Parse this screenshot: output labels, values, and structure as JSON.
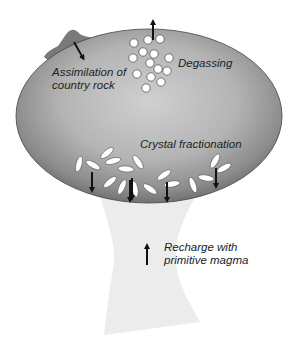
{
  "diagram": {
    "labels": {
      "assimilation": {
        "lines": [
          "Assimilation of",
          "country rock"
        ]
      },
      "degassing": {
        "lines": [
          "Degassing"
        ]
      },
      "crystal_fractionation": {
        "lines": [
          "Crystal fractionation"
        ]
      },
      "recharge": {
        "lines": [
          "Recharge with",
          "primitive magma"
        ]
      }
    },
    "components": {
      "magma_chamber": "ellipse with gray radial gradient",
      "conduit": "pale gray feeder conduit below chamber",
      "country_rock": "dark gray blob on upper-left chamber roof",
      "gas_bubbles": 15,
      "crystals": 20,
      "arrows": {
        "degassing": "up",
        "assimilation": "down-right into chamber",
        "crystal_settling": "down (5 arrows)",
        "recharge": "up"
      }
    },
    "colors": {
      "chamber_center": "#cccccc",
      "chamber_edge": "#6e6e6e",
      "conduit": "#ececec",
      "country_rock": "#7a7a7a",
      "bubble_fill": "#ffffff",
      "crystal_fill": "#ffffff",
      "arrow": "#111111",
      "text": "#222222"
    }
  }
}
